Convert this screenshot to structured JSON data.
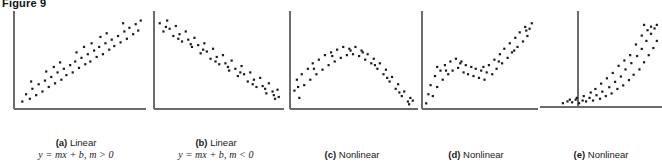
{
  "figure": {
    "title": "Figure 9",
    "width": 662,
    "height": 163,
    "axis_color": "#6b6b6b",
    "point_color": "#1a1a1a",
    "background": "#ffffff"
  },
  "panels": [
    {
      "id": "panel-a",
      "tag": "(a)",
      "label": "Linear",
      "equation": "y = mx + b, m > 0",
      "relationship": "positive-linear",
      "axis_style": "L-shape",
      "left": 6,
      "width": 140,
      "plot": {
        "w": 140,
        "h": 100,
        "x_axis_y": 98,
        "y_axis_x": 8
      },
      "chart_data": {
        "type": "scatter",
        "title": "Linear, positive slope",
        "xlabel": "",
        "ylabel": "",
        "xlim": [
          0,
          100
        ],
        "ylim": [
          0,
          100
        ],
        "grid": false,
        "legend": "none",
        "points": [
          [
            5,
            6
          ],
          [
            8,
            14
          ],
          [
            11,
            9
          ],
          [
            13,
            20
          ],
          [
            16,
            13
          ],
          [
            18,
            25
          ],
          [
            21,
            17
          ],
          [
            23,
            29
          ],
          [
            26,
            22
          ],
          [
            28,
            33
          ],
          [
            31,
            26
          ],
          [
            33,
            38
          ],
          [
            36,
            30
          ],
          [
            38,
            42
          ],
          [
            40,
            35
          ],
          [
            43,
            46
          ],
          [
            45,
            38
          ],
          [
            47,
            50
          ],
          [
            50,
            43
          ],
          [
            52,
            54
          ],
          [
            55,
            47
          ],
          [
            57,
            58
          ],
          [
            59,
            50
          ],
          [
            62,
            62
          ],
          [
            64,
            55
          ],
          [
            66,
            66
          ],
          [
            69,
            58
          ],
          [
            71,
            70
          ],
          [
            74,
            63
          ],
          [
            76,
            74
          ],
          [
            78,
            67
          ],
          [
            81,
            78
          ],
          [
            83,
            71
          ],
          [
            86,
            83
          ],
          [
            88,
            75
          ],
          [
            90,
            87
          ],
          [
            93,
            80
          ],
          [
            95,
            91
          ],
          [
            97,
            84
          ],
          [
            99,
            95
          ],
          [
            12,
            28
          ],
          [
            24,
            39
          ],
          [
            35,
            49
          ],
          [
            48,
            60
          ],
          [
            60,
            70
          ],
          [
            72,
            81
          ],
          [
            85,
            92
          ],
          [
            30,
            44
          ],
          [
            54,
            66
          ],
          [
            67,
            77
          ]
        ]
      }
    },
    {
      "id": "panel-b",
      "tag": "(b)",
      "label": "Linear",
      "equation": "y = mx + b, m < 0",
      "relationship": "negative-linear",
      "axis_style": "L-shape",
      "left": 148,
      "width": 136,
      "plot": {
        "w": 136,
        "h": 100,
        "x_axis_y": 98,
        "y_axis_x": 6
      },
      "chart_data": {
        "type": "scatter",
        "title": "Linear, negative slope",
        "xlabel": "",
        "ylabel": "",
        "xlim": [
          0,
          100
        ],
        "ylim": [
          0,
          100
        ],
        "grid": false,
        "legend": "none",
        "points": [
          [
            3,
            92
          ],
          [
            6,
            83
          ],
          [
            9,
            95
          ],
          [
            11,
            86
          ],
          [
            14,
            78
          ],
          [
            16,
            89
          ],
          [
            19,
            80
          ],
          [
            21,
            72
          ],
          [
            24,
            83
          ],
          [
            26,
            74
          ],
          [
            29,
            66
          ],
          [
            31,
            76
          ],
          [
            34,
            68
          ],
          [
            36,
            59
          ],
          [
            39,
            70
          ],
          [
            41,
            61
          ],
          [
            44,
            53
          ],
          [
            46,
            64
          ],
          [
            49,
            55
          ],
          [
            51,
            47
          ],
          [
            54,
            57
          ],
          [
            56,
            48
          ],
          [
            59,
            40
          ],
          [
            61,
            51
          ],
          [
            64,
            42
          ],
          [
            66,
            34
          ],
          [
            69,
            45
          ],
          [
            71,
            36
          ],
          [
            74,
            28
          ],
          [
            76,
            38
          ],
          [
            79,
            30
          ],
          [
            81,
            22
          ],
          [
            84,
            32
          ],
          [
            86,
            23
          ],
          [
            89,
            15
          ],
          [
            91,
            26
          ],
          [
            94,
            17
          ],
          [
            96,
            9
          ],
          [
            98,
            19
          ],
          [
            99,
            11
          ],
          [
            8,
            88
          ],
          [
            18,
            75
          ],
          [
            28,
            69
          ],
          [
            38,
            63
          ],
          [
            48,
            50
          ],
          [
            58,
            44
          ],
          [
            68,
            38
          ],
          [
            78,
            25
          ],
          [
            88,
            20
          ],
          [
            95,
            13
          ]
        ]
      }
    },
    {
      "id": "panel-c",
      "tag": "(c)",
      "label": "Nonlinear",
      "equation": "",
      "relationship": "inverted-u-quadratic",
      "axis_style": "L-shape",
      "left": 286,
      "width": 132,
      "plot": {
        "w": 132,
        "h": 100,
        "x_axis_y": 98,
        "y_axis_x": 4
      },
      "chart_data": {
        "type": "scatter",
        "title": "Nonlinear, inverted U",
        "xlabel": "",
        "ylabel": "",
        "xlim": [
          0,
          100
        ],
        "ylim": [
          0,
          100
        ],
        "grid": false,
        "legend": "none",
        "points": [
          [
            2,
            18
          ],
          [
            4,
            30
          ],
          [
            6,
            10
          ],
          [
            8,
            36
          ],
          [
            10,
            24
          ],
          [
            13,
            42
          ],
          [
            15,
            30
          ],
          [
            17,
            48
          ],
          [
            20,
            36
          ],
          [
            22,
            52
          ],
          [
            25,
            41
          ],
          [
            27,
            57
          ],
          [
            30,
            46
          ],
          [
            32,
            60
          ],
          [
            35,
            50
          ],
          [
            37,
            63
          ],
          [
            40,
            54
          ],
          [
            42,
            66
          ],
          [
            45,
            57
          ],
          [
            47,
            64
          ],
          [
            50,
            58
          ],
          [
            52,
            66
          ],
          [
            55,
            56
          ],
          [
            57,
            62
          ],
          [
            60,
            52
          ],
          [
            62,
            58
          ],
          [
            65,
            48
          ],
          [
            67,
            53
          ],
          [
            70,
            42
          ],
          [
            72,
            48
          ],
          [
            75,
            36
          ],
          [
            77,
            41
          ],
          [
            80,
            28
          ],
          [
            82,
            33
          ],
          [
            85,
            20
          ],
          [
            87,
            25
          ],
          [
            90,
            12
          ],
          [
            92,
            17
          ],
          [
            95,
            6
          ],
          [
            97,
            10
          ],
          [
            5,
            22
          ],
          [
            18,
            42
          ],
          [
            33,
            56
          ],
          [
            48,
            62
          ],
          [
            58,
            60
          ],
          [
            68,
            46
          ],
          [
            78,
            32
          ],
          [
            88,
            16
          ],
          [
            96,
            3
          ],
          [
            99,
            7
          ]
        ]
      }
    },
    {
      "id": "panel-d",
      "tag": "(d)",
      "label": "Nonlinear",
      "equation": "",
      "relationship": "s-curve-cubic",
      "axis_style": "L-shape",
      "left": 414,
      "width": 124,
      "plot": {
        "w": 124,
        "h": 100,
        "x_axis_y": 98,
        "y_axis_x": 8
      },
      "chart_data": {
        "type": "scatter",
        "title": "Nonlinear, S-shaped",
        "xlabel": "",
        "ylabel": "",
        "xlim": [
          0,
          100
        ],
        "ylim": [
          0,
          100
        ],
        "grid": false,
        "legend": "none",
        "points": [
          [
            2,
            4
          ],
          [
            4,
            14
          ],
          [
            6,
            24
          ],
          [
            8,
            12
          ],
          [
            10,
            34
          ],
          [
            12,
            22
          ],
          [
            15,
            40
          ],
          [
            17,
            30
          ],
          [
            19,
            46
          ],
          [
            22,
            36
          ],
          [
            24,
            50
          ],
          [
            26,
            40
          ],
          [
            29,
            53
          ],
          [
            31,
            43
          ],
          [
            33,
            48
          ],
          [
            36,
            38
          ],
          [
            38,
            46
          ],
          [
            40,
            36
          ],
          [
            43,
            44
          ],
          [
            45,
            34
          ],
          [
            47,
            42
          ],
          [
            50,
            32
          ],
          [
            52,
            40
          ],
          [
            55,
            30
          ],
          [
            57,
            38
          ],
          [
            59,
            46
          ],
          [
            62,
            36
          ],
          [
            64,
            52
          ],
          [
            66,
            42
          ],
          [
            69,
            58
          ],
          [
            71,
            48
          ],
          [
            73,
            64
          ],
          [
            76,
            54
          ],
          [
            78,
            70
          ],
          [
            80,
            60
          ],
          [
            83,
            76
          ],
          [
            85,
            66
          ],
          [
            87,
            82
          ],
          [
            90,
            72
          ],
          [
            92,
            88
          ],
          [
            94,
            78
          ],
          [
            96,
            86
          ],
          [
            98,
            92
          ],
          [
            12,
            44
          ],
          [
            20,
            40
          ],
          [
            34,
            50
          ],
          [
            54,
            44
          ],
          [
            68,
            50
          ],
          [
            82,
            62
          ],
          [
            93,
            84
          ]
        ]
      }
    },
    {
      "id": "panel-e",
      "tag": "(e)",
      "label": "Nonlinear",
      "equation": "",
      "relationship": "exponential",
      "axis_style": "cross-axis",
      "left": 540,
      "width": 122,
      "plot": {
        "w": 122,
        "h": 100,
        "x_axis_y": 96,
        "y_axis_x": 38
      },
      "chart_data": {
        "type": "scatter",
        "title": "Nonlinear, exponential",
        "xlabel": "",
        "ylabel": "",
        "xlim": [
          0,
          100
        ],
        "ylim": [
          0,
          100
        ],
        "grid": false,
        "legend": "none",
        "points": [
          [
            18,
            2
          ],
          [
            22,
            4
          ],
          [
            26,
            3
          ],
          [
            29,
            6
          ],
          [
            32,
            2
          ],
          [
            35,
            5
          ],
          [
            38,
            4
          ],
          [
            41,
            8
          ],
          [
            44,
            5
          ],
          [
            47,
            11
          ],
          [
            50,
            7
          ],
          [
            52,
            15
          ],
          [
            55,
            10
          ],
          [
            58,
            20
          ],
          [
            60,
            13
          ],
          [
            63,
            26
          ],
          [
            65,
            18
          ],
          [
            68,
            32
          ],
          [
            70,
            22
          ],
          [
            72,
            40
          ],
          [
            75,
            28
          ],
          [
            77,
            47
          ],
          [
            79,
            34
          ],
          [
            82,
            55
          ],
          [
            84,
            40
          ],
          [
            86,
            63
          ],
          [
            88,
            48
          ],
          [
            90,
            72
          ],
          [
            92,
            56
          ],
          [
            94,
            80
          ],
          [
            96,
            64
          ],
          [
            97,
            86
          ],
          [
            99,
            72
          ],
          [
            86,
            78
          ],
          [
            91,
            84
          ],
          [
            81,
            68
          ],
          [
            76,
            56
          ],
          [
            71,
            50
          ],
          [
            66,
            44
          ],
          [
            61,
            36
          ],
          [
            56,
            30
          ],
          [
            51,
            24
          ],
          [
            46,
            18
          ],
          [
            42,
            14
          ],
          [
            36,
            10
          ],
          [
            30,
            8
          ],
          [
            24,
            6
          ],
          [
            94,
            88
          ],
          [
            99,
            90
          ],
          [
            88,
            90
          ]
        ]
      }
    }
  ]
}
